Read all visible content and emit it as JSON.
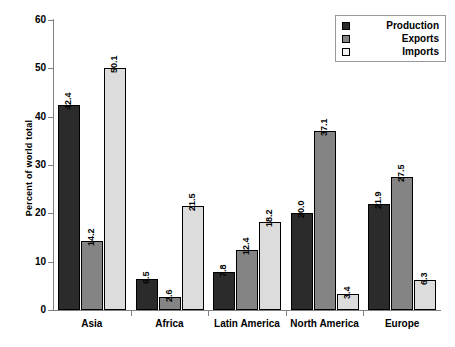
{
  "chart_data": {
    "type": "bar",
    "title": "",
    "xlabel": "",
    "ylabel": "Percent of world total",
    "ylim": [
      0,
      60
    ],
    "yticks": [
      0,
      10,
      20,
      30,
      40,
      50,
      60
    ],
    "ytick_labels": [
      "0",
      "10",
      "20",
      "30",
      "40",
      "50",
      "60"
    ],
    "grid": false,
    "legend_position": "top-right",
    "categories": [
      "Asia",
      "Africa",
      "Latin America",
      "North America",
      "Europe"
    ],
    "series": [
      {
        "name": "Production",
        "color": "#2b2b2b",
        "values": [
          42.4,
          6.5,
          7.8,
          20.0,
          21.9
        ],
        "labels": [
          "42.4",
          "6.5",
          "7.8",
          "20.0",
          "21.9"
        ]
      },
      {
        "name": "Exports",
        "color": "#848484",
        "values": [
          14.2,
          2.6,
          12.4,
          37.1,
          27.5
        ],
        "labels": [
          "14.2",
          "2.6",
          "12.4",
          "37.1",
          "27.5"
        ]
      },
      {
        "name": "Imports",
        "color": "#dcdcdc",
        "values": [
          50.1,
          21.5,
          18.2,
          3.4,
          6.3
        ],
        "labels": [
          "50.1",
          "21.5",
          "18.2",
          "3.4",
          "6.3"
        ]
      }
    ]
  },
  "legend": {
    "items": [
      {
        "label": "Production",
        "swatch": "production"
      },
      {
        "label": "Exports",
        "swatch": "exports"
      },
      {
        "label": "Imports",
        "swatch": "imports"
      }
    ]
  }
}
